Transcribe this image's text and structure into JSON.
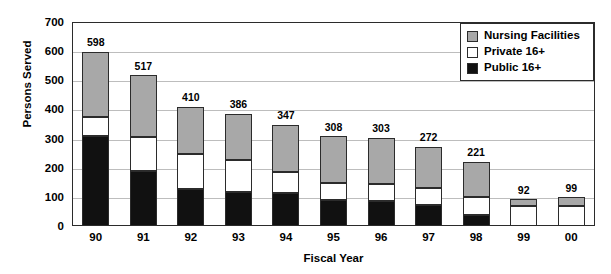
{
  "chart_data": {
    "type": "bar",
    "title": "",
    "xlabel": "Fiscal Year",
    "ylabel": "Persons Served",
    "ylim": [
      0,
      700
    ],
    "ytick_step": 100,
    "yticks": [
      700,
      600,
      500,
      400,
      300,
      200,
      100,
      0
    ],
    "grid": true,
    "stacked": true,
    "legend_position": "top-right",
    "categories": [
      "90",
      "91",
      "92",
      "93",
      "94",
      "95",
      "96",
      "97",
      "98",
      "99",
      "00"
    ],
    "series": [
      {
        "name": "Public 16+",
        "color": "#111111",
        "values": [
          310,
          190,
          128,
          117,
          113,
          90,
          85,
          72,
          38,
          0,
          0
        ]
      },
      {
        "name": "Private 16+",
        "color": "#ffffff",
        "values": [
          63,
          117,
          119,
          108,
          72,
          58,
          58,
          60,
          60,
          70,
          68
        ]
      },
      {
        "name": "Nursing Facilities",
        "color": "#a8a8a8",
        "values": [
          225,
          210,
          163,
          161,
          162,
          160,
          160,
          140,
          123,
          22,
          31
        ]
      }
    ],
    "totals": [
      598,
      517,
      410,
      386,
      347,
      308,
      303,
      272,
      221,
      92,
      99
    ],
    "total_labels": [
      "598",
      "517",
      "410",
      "386",
      "347",
      "308",
      "303",
      "272",
      "221",
      "92",
      "99"
    ]
  },
  "legend": {
    "items": [
      {
        "label": "Nursing Facilities",
        "swatch": "nursing"
      },
      {
        "label": "Private 16+",
        "swatch": "private"
      },
      {
        "label": "Public 16+",
        "swatch": "public"
      }
    ]
  },
  "axes": {
    "y_title": "Persons Served",
    "x_title": "Fiscal Year",
    "y_tick_labels": [
      "700",
      "600",
      "500",
      "400",
      "300",
      "200",
      "100",
      "0"
    ],
    "x_tick_labels": [
      "90",
      "91",
      "92",
      "93",
      "94",
      "95",
      "96",
      "97",
      "98",
      "99",
      "00"
    ]
  },
  "colors": {
    "public": "#111111",
    "private": "#ffffff",
    "nursing": "#a8a8a8",
    "axis": "#2b2b2b",
    "grid": "#bdbdbd"
  }
}
